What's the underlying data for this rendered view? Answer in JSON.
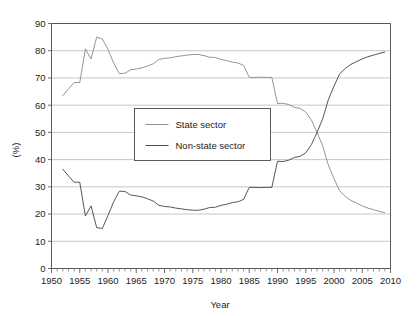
{
  "chart_data": {
    "type": "line",
    "title": "",
    "xlabel": "Year",
    "ylabel": "(%)",
    "xlim": [
      1950,
      2010
    ],
    "ylim": [
      0,
      90
    ],
    "grid": true,
    "legend_position": "center-left-inside",
    "x_tick_labels": [
      "1950",
      "1955",
      "1960",
      "1965",
      "1970",
      "1975",
      "1980",
      "1985",
      "1990",
      "1995",
      "2000",
      "2005",
      "2010"
    ],
    "x_tick_values": [
      1950,
      1955,
      1960,
      1965,
      1970,
      1975,
      1980,
      1985,
      1990,
      1995,
      2000,
      2005,
      2010
    ],
    "x_minor_step": 1,
    "y_tick_labels": [
      "0",
      "10",
      "20",
      "30",
      "40",
      "50",
      "60",
      "70",
      "80",
      "90"
    ],
    "y_tick_values": [
      0,
      10,
      20,
      30,
      40,
      50,
      60,
      70,
      80,
      90
    ],
    "x": [
      1952,
      1953,
      1954,
      1955,
      1956,
      1957,
      1958,
      1959,
      1960,
      1961,
      1962,
      1963,
      1964,
      1965,
      1966,
      1967,
      1968,
      1969,
      1970,
      1971,
      1972,
      1973,
      1974,
      1975,
      1976,
      1977,
      1978,
      1979,
      1980,
      1981,
      1982,
      1983,
      1984,
      1985,
      1986,
      1987,
      1988,
      1989,
      1990,
      1991,
      1992,
      1993,
      1994,
      1995,
      1996,
      1997,
      1998,
      1999,
      2000,
      2001,
      2002,
      2003,
      2004,
      2005,
      2006,
      2007,
      2008,
      2009
    ],
    "series": [
      {
        "name": "State sector",
        "color": "#8f8f8f",
        "values": [
          63.5,
          66.0,
          68.3,
          68.3,
          80.7,
          77.0,
          85.0,
          84.3,
          80.5,
          75.5,
          71.6,
          71.7,
          73.0,
          73.3,
          73.7,
          74.4,
          75.2,
          76.8,
          77.2,
          77.4,
          77.8,
          78.1,
          78.4,
          78.6,
          78.6,
          78.2,
          77.6,
          77.5,
          76.8,
          76.4,
          75.8,
          75.5,
          74.6,
          70.2,
          70.2,
          70.3,
          70.2,
          70.2,
          60.6,
          60.7,
          60.2,
          59.2,
          58.8,
          57.5,
          54.5,
          50.0,
          45.0,
          38.0,
          33.0,
          28.5,
          26.5,
          25.0,
          24.0,
          23.0,
          22.2,
          21.6,
          21.0,
          20.5
        ]
      },
      {
        "name": "Non-state sector",
        "color": "#4d4d4d",
        "values": [
          36.5,
          34.0,
          31.7,
          31.7,
          19.3,
          23.0,
          15.0,
          14.7,
          19.5,
          24.5,
          28.4,
          28.3,
          27.0,
          26.7,
          26.3,
          25.6,
          24.8,
          23.2,
          22.8,
          22.6,
          22.2,
          21.9,
          21.6,
          21.4,
          21.4,
          21.8,
          22.4,
          22.5,
          23.2,
          23.6,
          24.2,
          24.5,
          25.4,
          29.8,
          29.8,
          29.7,
          29.8,
          29.8,
          39.4,
          39.3,
          39.8,
          40.8,
          41.2,
          42.5,
          45.5,
          50.0,
          55.0,
          62.0,
          67.0,
          71.5,
          73.5,
          75.0,
          76.0,
          77.0,
          77.8,
          78.4,
          79.0,
          79.5
        ]
      }
    ]
  },
  "legend": {
    "entries": [
      {
        "label": "State sector"
      },
      {
        "label": "Non-state sector"
      }
    ]
  }
}
